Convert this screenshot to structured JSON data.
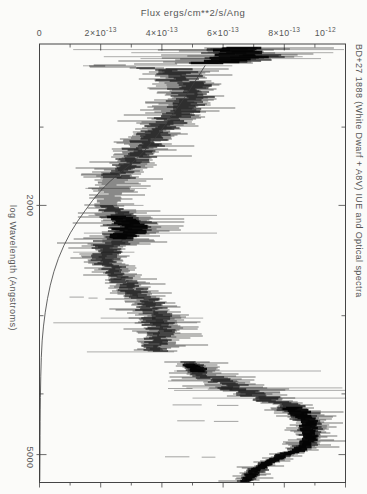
{
  "figure": {
    "background": "#fbfbf9",
    "ink_color": "#111111",
    "frame_color": "#454545",
    "text_color": "#565656",
    "model_curve_color": "#3c3c3c"
  },
  "annotation_right": "BD+27 1888 (White Dwarf + A8V) IUE and Optical spectra",
  "chart_data": {
    "type": "line",
    "subtype": "rotated-spectrum",
    "title": "Flux ergs/cm**2/s/Ang",
    "xlabel": "Flux ergs/cm**2/s/Ang",
    "ylabel": "log Wavelength (Angstroms)",
    "x_axis": {
      "unit": "1e-13 erg/cm**2/s/Ang",
      "range": [
        0,
        10.0
      ],
      "major_ticks": [
        0,
        2,
        4,
        6,
        8,
        10
      ],
      "minor_ticks": [
        1,
        3,
        5,
        7,
        9
      ],
      "tick_labels": [
        {
          "text": "0",
          "sup": "",
          "value": 0
        },
        {
          "text": "2×10",
          "sup": "-13",
          "value": 2
        },
        {
          "text": "4×10",
          "sup": "-13",
          "value": 4
        },
        {
          "text": "6×10",
          "sup": "-13",
          "value": 6
        },
        {
          "text": "8×10",
          "sup": "-13",
          "value": 8
        },
        {
          "text": "10",
          "sup": "-12",
          "value": 10
        }
      ]
    },
    "y_axis": {
      "scale": "log",
      "unit": "Angstrom",
      "range": [
        1105,
        5540
      ],
      "major_ticks": [
        2000,
        5000
      ],
      "minor_ticks": [
        1500,
        3000,
        4000
      ],
      "tick_labels": [
        {
          "text": "2000",
          "value": 2000
        },
        {
          "text": "5000",
          "value": 5000
        }
      ]
    },
    "grid": false,
    "legend": false,
    "series": [
      {
        "name": "observed-spectrum",
        "style": "noisy-band",
        "note": "flux in 1e-13 erg/cm**2/s/Ang; entries are [wavelength_A, flux_center, flux_halfwidth, density(1-3)]",
        "segments": [
          {
            "name": "IUE-ultraviolet",
            "profile": [
              [
                1121,
                6.4,
                1.5,
                3
              ],
              [
                1133,
                6.5,
                1.5,
                3
              ],
              [
                1158,
                6.6,
                1.6,
                3
              ],
              [
                1184,
                6.0,
                1.5,
                3
              ],
              [
                1191,
                3.2,
                0.8,
                1
              ],
              [
                1197,
                1.7,
                0.3,
                1
              ],
              [
                1203,
                3.0,
                0.7,
                1
              ],
              [
                1210,
                4.2,
                0.9,
                2
              ],
              [
                1228,
                4.6,
                1.0,
                2
              ],
              [
                1265,
                4.7,
                0.95,
                2
              ],
              [
                1336,
                5.0,
                0.92,
                2
              ],
              [
                1411,
                4.6,
                0.85,
                2
              ],
              [
                1491,
                4.1,
                0.8,
                2
              ],
              [
                1587,
                3.55,
                0.75,
                2
              ],
              [
                1683,
                3.1,
                0.72,
                2
              ],
              [
                1772,
                2.65,
                0.68,
                2
              ],
              [
                1858,
                2.4,
                0.6,
                1
              ],
              [
                1963,
                2.3,
                0.6,
                1
              ],
              [
                2037,
                2.4,
                0.65,
                2
              ],
              [
                2129,
                2.95,
                0.95,
                3
              ],
              [
                2208,
                2.9,
                1.0,
                3
              ],
              [
                2316,
                2.4,
                0.75,
                2
              ],
              [
                2429,
                2.15,
                0.6,
                2
              ],
              [
                2539,
                2.35,
                0.55,
                2
              ],
              [
                2682,
                2.9,
                0.6,
                2
              ],
              [
                2782,
                3.3,
                0.6,
                2
              ],
              [
                2917,
                3.7,
                0.65,
                2
              ],
              [
                3027,
                3.85,
                0.7,
                2
              ],
              [
                3163,
                3.95,
                0.65,
                2
              ],
              [
                3341,
                3.9,
                0.65,
                2
              ],
              [
                3428,
                3.8,
                0.6,
                2
              ]
            ]
          },
          {
            "name": "optical",
            "profile": [
              [
                3557,
                4.9,
                0.5,
                2
              ],
              [
                3636,
                5.1,
                0.6,
                3
              ],
              [
                3731,
                5.4,
                0.65,
                2
              ],
              [
                3869,
                6.1,
                0.8,
                2
              ],
              [
                4014,
                7.0,
                0.8,
                2
              ],
              [
                4134,
                8.0,
                0.7,
                2
              ],
              [
                4273,
                8.5,
                0.7,
                3
              ],
              [
                4432,
                8.8,
                0.6,
                3
              ],
              [
                4564,
                8.85,
                0.55,
                3
              ],
              [
                4735,
                8.8,
                0.5,
                3
              ],
              [
                4912,
                8.5,
                0.5,
                3
              ],
              [
                5003,
                8.0,
                0.45,
                3
              ],
              [
                5096,
                7.6,
                0.45,
                3
              ],
              [
                5209,
                7.3,
                0.4,
                3
              ],
              [
                5325,
                7.05,
                0.4,
                3
              ],
              [
                5443,
                6.85,
                0.4,
                3
              ],
              [
                5524,
                6.7,
                0.4,
                3
              ]
            ]
          }
        ],
        "spike_rows": [
          [
            1128,
            1.1,
            9.95
          ],
          [
            1141,
            3.0,
            9.6
          ],
          [
            1158,
            2.1,
            8.6
          ],
          [
            1166,
            3.3,
            9.2
          ],
          [
            1197,
            1.42,
            6.3
          ],
          [
            1879,
            1.5,
            3.5
          ],
          [
            2000,
            1.8,
            3.4
          ],
          [
            2075,
            1.6,
            5.8
          ],
          [
            2215,
            1.45,
            5.8
          ],
          [
            2376,
            1.1,
            3.1
          ],
          [
            3027,
            2.0,
            5.35
          ],
          [
            3080,
            0.45,
            5.15
          ],
          [
            3428,
            1.55,
            4.4
          ],
          [
            3677,
            4.4,
            9.2
          ],
          [
            3912,
            4.8,
            9.9
          ],
          [
            3948,
            4.4,
            10.0
          ],
          [
            4062,
            5.0,
            10.05
          ]
        ],
        "absorption_dash_rows": [
          [
            2802,
            0.98,
            1.45
          ],
          [
            2812,
            1.6,
            1.9
          ],
          [
            3814,
            4.2,
            5.5
          ],
          [
            3820,
            5.8,
            6.5
          ],
          [
            3921,
            4.2,
            5.0
          ],
          [
            3930,
            5.5,
            6.3
          ],
          [
            4165,
            4.35,
            5.3
          ],
          [
            4172,
            5.8,
            6.5
          ],
          [
            4416,
            4.5,
            5.4
          ],
          [
            4425,
            5.7,
            6.5
          ],
          [
            5040,
            4.1,
            4.9
          ],
          [
            5048,
            5.3,
            5.75
          ]
        ]
      },
      {
        "name": "model-continuum",
        "style": "smooth-curve",
        "points": [
          [
            1197,
            5.41
          ],
          [
            1322,
            4.85
          ],
          [
            1438,
            4.33
          ],
          [
            1565,
            3.77
          ],
          [
            1683,
            3.22
          ],
          [
            1772,
            2.63
          ],
          [
            1893,
            1.98
          ],
          [
            2037,
            1.49
          ],
          [
            2208,
            1.0
          ],
          [
            2429,
            0.6
          ],
          [
            2682,
            0.34
          ],
          [
            2961,
            0.18
          ],
          [
            3281,
            0.08
          ],
          [
            3731,
            0.04
          ],
          [
            4400,
            0.02
          ],
          [
            5500,
            0.01
          ]
        ]
      }
    ]
  }
}
